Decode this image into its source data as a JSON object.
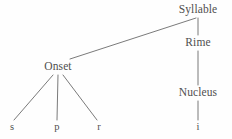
{
  "diagram": {
    "type": "syllable-structure-tree",
    "title": "Syllable",
    "canvas": {
      "width": 232,
      "height": 139
    },
    "colors": {
      "background": "#fefefe",
      "text": "#4f4f4f",
      "edge": "#6b6b6b"
    },
    "nodes": [
      {
        "id": "syllable",
        "label": "Syllable",
        "kind": "internal",
        "x": 198,
        "y": 10
      },
      {
        "id": "rime",
        "label": "Rime",
        "kind": "internal",
        "x": 198,
        "y": 43
      },
      {
        "id": "onset",
        "label": "Onset",
        "kind": "internal",
        "x": 58,
        "y": 67
      },
      {
        "id": "nucleus",
        "label": "Nucleus",
        "kind": "internal",
        "x": 198,
        "y": 93
      },
      {
        "id": "s",
        "label": "s",
        "kind": "terminal",
        "x": 12,
        "y": 127
      },
      {
        "id": "p",
        "label": "p",
        "kind": "terminal",
        "x": 57,
        "y": 127
      },
      {
        "id": "r",
        "label": "r",
        "kind": "terminal",
        "x": 99,
        "y": 127
      },
      {
        "id": "i",
        "label": "i",
        "kind": "terminal",
        "x": 198,
        "y": 127
      }
    ],
    "edges": [
      {
        "id": "syllable-onset",
        "from": "syllable",
        "to": "onset",
        "x1": 196,
        "y1": 18,
        "x2": 70,
        "y2": 59
      },
      {
        "id": "syllable-rime",
        "from": "syllable",
        "to": "rime",
        "x1": 198,
        "y1": 18,
        "x2": 198,
        "y2": 35
      },
      {
        "id": "rime-nucleus",
        "from": "rime",
        "to": "nucleus",
        "x1": 198,
        "y1": 51,
        "x2": 198,
        "y2": 85
      },
      {
        "id": "nucleus-i",
        "from": "nucleus",
        "to": "i",
        "x1": 198,
        "y1": 101,
        "x2": 198,
        "y2": 120
      },
      {
        "id": "onset-s",
        "from": "onset",
        "to": "s",
        "x1": 53,
        "y1": 75,
        "x2": 14,
        "y2": 120
      },
      {
        "id": "onset-p",
        "from": "onset",
        "to": "p",
        "x1": 58,
        "y1": 75,
        "x2": 57,
        "y2": 120
      },
      {
        "id": "onset-r",
        "from": "onset",
        "to": "r",
        "x1": 63,
        "y1": 75,
        "x2": 97,
        "y2": 120
      }
    ]
  }
}
